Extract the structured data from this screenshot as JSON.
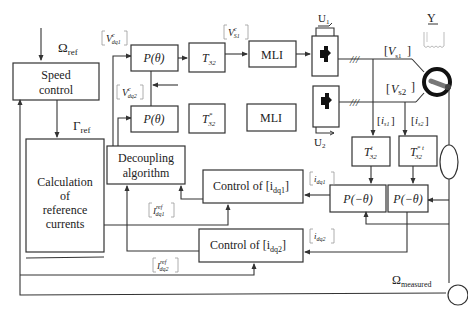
{
  "diagram": {
    "type": "control block diagram",
    "inputs": {
      "speed_ref": "Ω",
      "speed_ref_sub": "ref",
      "torque_ref": "Γ",
      "torque_ref_sub": "ref",
      "speed_measured": "Ω",
      "speed_measured_sub": "measured"
    },
    "blocks": {
      "speed_control": [
        "Speed",
        "control"
      ],
      "calc_ref": [
        "Calculation",
        "of",
        "reference",
        "currents"
      ],
      "decoupling": [
        "Decoupling",
        "algorithm"
      ],
      "p_theta_1": "P(θ)",
      "p_theta_2": "P(θ)",
      "t32_1": "T",
      "t32_1_sub": "32",
      "t32_2": "T",
      "t32_2_sub": "32",
      "t32_2_sup": "*",
      "mli_1": "MLI",
      "mli_2": "MLI",
      "control_idq1": "Control of [i",
      "control_idq1_sub": "dq1",
      "control_idq2": "Control of [i",
      "control_idq2_sub": "dq2",
      "t32t_1": "T",
      "t32t_1_sub": "32",
      "t32t_1_sup": "t",
      "t32t_2": "T",
      "t32t_2_sub": "32",
      "t32t_2_sup": "* t",
      "p_minus_theta_1": "P(−θ)",
      "p_minus_theta_2": "P(−θ)",
      "close_bracket": "]"
    },
    "signals": {
      "v_dq1": "V",
      "v_dq1_sup": "c",
      "v_dq1_sub": "dq1",
      "v_dq2": "V",
      "v_dq2_sup": "c",
      "v_dq2_sub": "dq2",
      "v_s1_ref": "V",
      "v_s1_ref_sup": "c",
      "v_s1_ref_sub": "S1",
      "v_s1": "V",
      "v_s1_sub": "s1",
      "v_s2": "V",
      "v_s2_sub": "s2",
      "i_s1": "i",
      "i_s1_sub": "s1",
      "i_s2": "i",
      "i_s2_sub": "s2",
      "i_dq1": "i",
      "i_dq1_sub": "dq1",
      "i_dq2": "i",
      "i_dq2_sub": "dq2",
      "i_dq1_ref": "I",
      "i_dq1_ref_sup": "ref",
      "i_dq1_ref_sub": "dq1",
      "i_dq2_ref": "I",
      "i_dq2_ref_sup": "ref",
      "i_dq2_ref_sub": "dq2",
      "u1": "U",
      "u1_sub": "1",
      "u2": "U",
      "u2_sub": "2",
      "y": "Y",
      "three_phase": "///"
    }
  }
}
